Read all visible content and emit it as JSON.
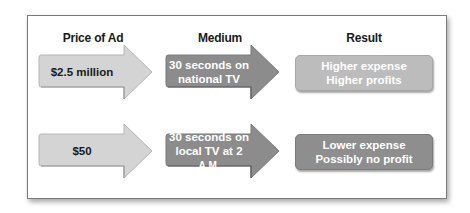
{
  "diagram": {
    "headers": {
      "price": "Price of Ad",
      "medium": "Medium",
      "result": "Result"
    },
    "rows": [
      {
        "price": "$2.5 million",
        "medium_line1": "30 seconds on",
        "medium_line2": "national TV",
        "result_line1": "Higher expense",
        "result_line2": "Higher profits"
      },
      {
        "price": "$50",
        "medium_line1": "30 seconds on",
        "medium_line2_prefix": "local TV at 2 ",
        "medium_line2_suffix": "A.M.",
        "result_line1": "Lower expense",
        "result_line2": "Possibly no profit"
      }
    ],
    "colors": {
      "price_arrow": "#d4d4d4",
      "medium_arrow": "#8c8c8c",
      "result_row1": "#bcbcbc",
      "result_row2": "#8e8e8e",
      "frame_border": "#7a7a7a"
    }
  }
}
